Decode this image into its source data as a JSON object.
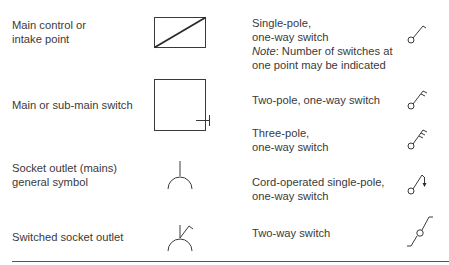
{
  "left_column": [
    {
      "id": "main-control",
      "label_lines": [
        "Main control or",
        "intake point"
      ],
      "symbol": "rectangle-diagonal-icon"
    },
    {
      "id": "main-switch",
      "label_lines": [
        "Main or sub-main switch"
      ],
      "symbol": "square-with-tick-icon"
    },
    {
      "id": "socket-outlet",
      "label_lines": [
        "Socket outlet (mains)",
        "general symbol"
      ],
      "symbol": "socket-outlet-icon"
    },
    {
      "id": "switched-socket",
      "label_lines": [
        "Switched socket outlet"
      ],
      "symbol": "switched-socket-icon"
    }
  ],
  "right_column": [
    {
      "id": "single-pole",
      "label_lines": [
        "Single-pole,",
        "one-way switch"
      ],
      "note_prefix": "Note",
      "note_rest": ": Number of switches at",
      "note_line2": "one point may be indicated",
      "symbol": "single-pole-switch-icon"
    },
    {
      "id": "two-pole",
      "label_lines": [
        "Two-pole, one-way switch"
      ],
      "symbol": "two-pole-switch-icon"
    },
    {
      "id": "three-pole",
      "label_lines": [
        "Three-pole,",
        "one-way switch"
      ],
      "symbol": "three-pole-switch-icon"
    },
    {
      "id": "cord-operated",
      "label_lines": [
        "Cord-operated single-pole,",
        "one-way switch"
      ],
      "symbol": "cord-operated-switch-icon"
    },
    {
      "id": "two-way",
      "label_lines": [
        "Two-way switch"
      ],
      "symbol": "two-way-switch-icon"
    }
  ],
  "colors": {
    "line": "#3a3a3a",
    "text": "#3a3a3a",
    "background": "#ffffff"
  }
}
